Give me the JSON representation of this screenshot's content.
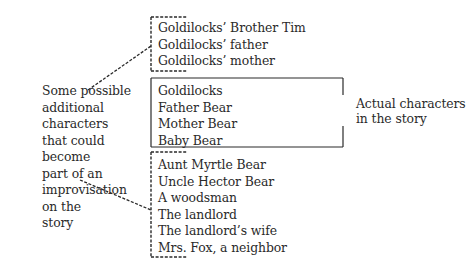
{
  "left_label": {
    "lines": [
      "Some possible",
      "additional",
      "characters",
      "that could",
      "become",
      "part of an",
      "improvisation",
      "on the",
      "story"
    ]
  },
  "groups": {
    "possible_top": {
      "items": [
        "Goldilocks’ Brother Tim",
        "Goldilocks’ father",
        "Goldilocks’ mother"
      ]
    },
    "actual": {
      "items": [
        "Goldilocks",
        "Father Bear",
        "Mother Bear",
        "Baby Bear"
      ],
      "label_lines": [
        "Actual characters",
        "in the story"
      ]
    },
    "possible_bottom": {
      "items": [
        "Aunt Myrtle Bear",
        "Uncle Hector Bear",
        "A woodsman",
        "The landlord",
        "The landlord’s wife",
        "Mrs. Fox, a neighbor"
      ]
    }
  },
  "colors": {
    "ink": "#2a2a2a",
    "background": "#ffffff"
  }
}
